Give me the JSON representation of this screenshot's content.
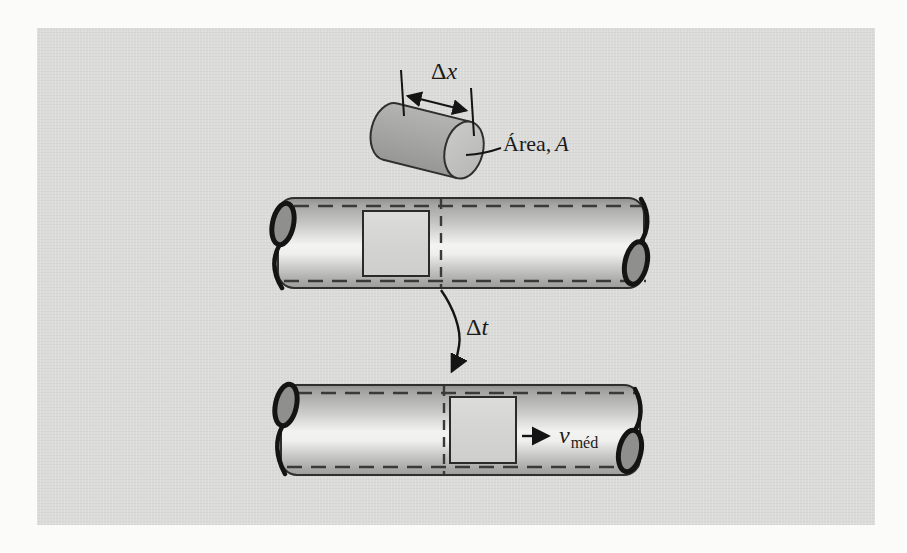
{
  "figure": {
    "type": "physics-diagram",
    "panel_background": "#dbdbd9",
    "page_background": "#fbfbfa"
  },
  "labels": {
    "delta_x": {
      "delta": "Δ",
      "symbol": "x"
    },
    "area": {
      "word": "Área,",
      "symbol": "A"
    },
    "delta_t": {
      "delta": "Δ",
      "symbol": "t"
    },
    "v_avg": {
      "symbol": "v",
      "subscript": "méd"
    }
  },
  "colors": {
    "outline": "#2f2f2d",
    "arrow": "#141414",
    "dashed_line": "#3a3a38",
    "tube_top": "#a2a2a0",
    "tube_highlight": "#f3f3f1",
    "tube_shadow": "#9e9e9c",
    "square_fill": "#d6d6d4",
    "cylinder_body": "#a7a7a5",
    "cylinder_face": "#c3c3c1",
    "curl_fill": "#8f8f8d"
  }
}
